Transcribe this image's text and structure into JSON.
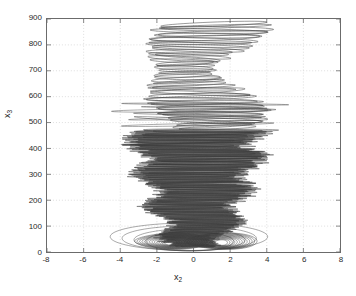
{
  "chart_data": {
    "type": "line",
    "title": "",
    "subtitle": "",
    "xlabel": "x_2",
    "xlabel_base": "x",
    "xlabel_sub": "2",
    "ylabel": "x_3",
    "ylabel_base": "x",
    "ylabel_sub": "3",
    "xlim": [
      -8,
      8
    ],
    "ylim": [
      0,
      900
    ],
    "xticks": [
      -8,
      -6,
      -4,
      -2,
      0,
      2,
      4,
      6,
      8
    ],
    "xtick_labels": [
      "-8",
      "-6",
      "-4",
      "-2",
      "0",
      "2",
      "4",
      "6",
      "8"
    ],
    "yticks": [
      0,
      100,
      200,
      300,
      400,
      500,
      600,
      700,
      800,
      900
    ],
    "ytick_labels": [
      "0",
      "100",
      "200",
      "300",
      "400",
      "500",
      "600",
      "700",
      "800",
      "900"
    ],
    "grid": true,
    "grid_style": "dotted",
    "grid_color": "#c8c8c8",
    "legend": null,
    "legend_position": "none",
    "axes_color": "#6b6b6b",
    "line_color": "#3a3a3a",
    "background": "#ffffff",
    "series": [
      {
        "name": "trajectory",
        "color": "#3a3a3a",
        "regions": [
          {
            "name": "upper-sparse-loops",
            "y_range": [
              480,
              880
            ],
            "x_half_width_range": [
              2.2,
              3.4
            ],
            "loop_count": 46,
            "loop_height": 9
          },
          {
            "name": "dense-core",
            "y_range": [
              20,
              470
            ],
            "x_half_width_range": [
              0.6,
              3.3
            ],
            "loop_count": 260,
            "loop_height": 5
          },
          {
            "name": "bottom-nested-lobes",
            "y_range": [
              0,
              120
            ],
            "lobe_centers_x": [
              -1.25,
              1.5
            ],
            "lobe_outer_half_width": [
              2.0,
              2.0
            ],
            "outer_orbit_x_range": [
              -4.5,
              4.0
            ],
            "orbit_count": 13
          }
        ]
      }
    ]
  }
}
